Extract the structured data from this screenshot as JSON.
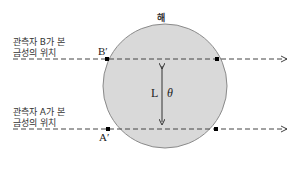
{
  "diagram": {
    "sun_label": "해",
    "observer_b_line1": "관측자 B가 본",
    "observer_b_line2": "금성의 위치",
    "observer_a_line1": "관측자 A가 본",
    "observer_a_line2": "금성의 위치",
    "point_b": "B′",
    "point_a": "A′",
    "distance_label": "L",
    "angle_label": "θ",
    "colors": {
      "sun_fill": "#d9d9d9",
      "sun_stroke": "#8a8a8a",
      "line": "#444444",
      "point": "#000000"
    }
  }
}
